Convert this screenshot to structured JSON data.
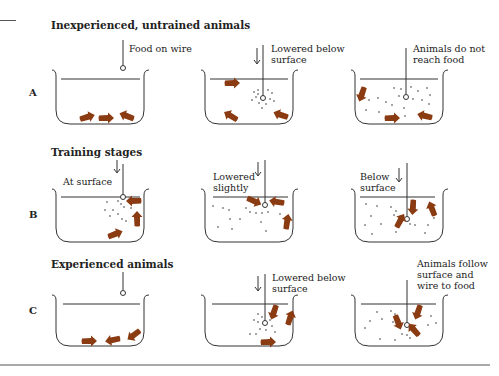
{
  "figure": {
    "rows": [
      {
        "label": "A",
        "heading": "Inexperienced, untrained animals",
        "panels": [
          {
            "annotation": "Food on wire"
          },
          {
            "annotation": "Lowered below\nsurface"
          },
          {
            "annotation": "Animals do not\nreach food"
          }
        ]
      },
      {
        "label": "B",
        "heading": "Training stages",
        "panels": [
          {
            "annotation": "At surface"
          },
          {
            "annotation": "Lowered\nslightly"
          },
          {
            "annotation": "Below\nsurface"
          }
        ]
      },
      {
        "label": "C",
        "heading": "Experienced animals",
        "panels": [
          {
            "annotation": ""
          },
          {
            "annotation": "Lowered below\nsurface"
          },
          {
            "annotation": "Animals follow\nsurface and\nwire to food"
          }
        ]
      }
    ],
    "colors": {
      "animal": "#8a3b12",
      "line": "#333333"
    }
  }
}
